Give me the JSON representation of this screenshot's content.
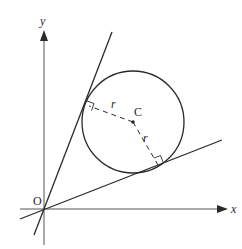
{
  "diagram": {
    "type": "geometry",
    "axes": {
      "x_label": "x",
      "y_label": "y",
      "origin_label": "O"
    },
    "circle": {
      "centre_label": "C",
      "radius_label": "r"
    },
    "labels": {
      "radius_upper": "r",
      "radius_lower": "r"
    },
    "colors": {
      "stroke": "#2a2a2a",
      "axis": "#555555",
      "background": "#ffffff"
    }
  }
}
